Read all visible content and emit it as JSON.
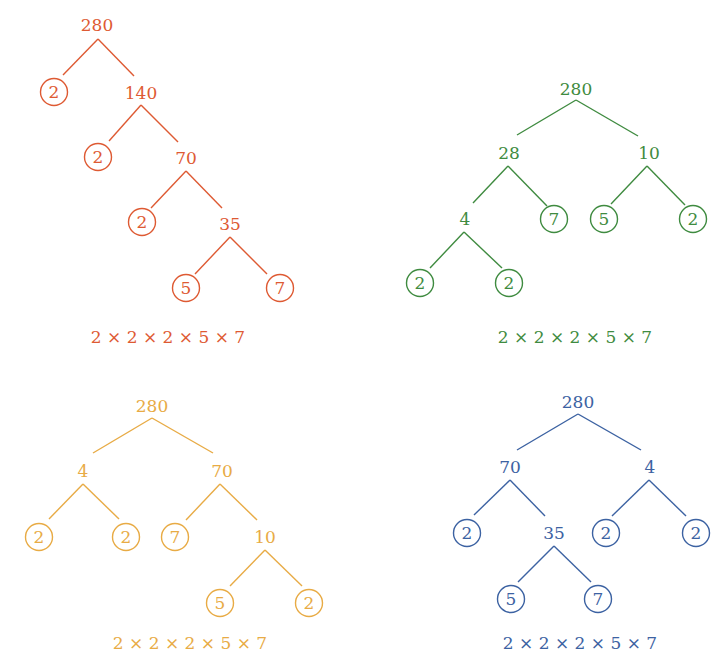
{
  "title": "Factor trees of 280",
  "colors": {
    "red": "#DE5A33",
    "green": "#3F8B40",
    "yellow": "#E8AB45",
    "blue": "#3C62A2"
  },
  "trees": [
    {
      "id": "tree-red",
      "color": "#DE5A33",
      "formula": "2 × 2 × 2 × 5 × 7",
      "formula_pos": [
        168,
        343
      ],
      "nodes": [
        {
          "id": "a",
          "label": "280",
          "x": 97,
          "y": 25,
          "prime": false
        },
        {
          "id": "b",
          "label": "2",
          "x": 54,
          "y": 92,
          "prime": true
        },
        {
          "id": "c",
          "label": "140",
          "x": 141,
          "y": 93,
          "prime": false
        },
        {
          "id": "d",
          "label": "2",
          "x": 98,
          "y": 157,
          "prime": true
        },
        {
          "id": "e",
          "label": "70",
          "x": 186,
          "y": 158,
          "prime": false
        },
        {
          "id": "f",
          "label": "2",
          "x": 142,
          "y": 222,
          "prime": true
        },
        {
          "id": "g",
          "label": "35",
          "x": 230,
          "y": 224,
          "prime": false
        },
        {
          "id": "h",
          "label": "5",
          "x": 186,
          "y": 288,
          "prime": true
        },
        {
          "id": "i",
          "label": "7",
          "x": 280,
          "y": 288,
          "prime": true
        }
      ],
      "edges": [
        [
          [
            98,
            39
          ],
          [
            63,
            75
          ]
        ],
        [
          [
            98,
            39
          ],
          [
            134,
            76
          ]
        ],
        [
          [
            141,
            105
          ],
          [
            109,
            141
          ]
        ],
        [
          [
            141,
            105
          ],
          [
            178,
            142
          ]
        ],
        [
          [
            186,
            171
          ],
          [
            151,
            208
          ]
        ],
        [
          [
            186,
            171
          ],
          [
            222,
            208
          ]
        ],
        [
          [
            230,
            237
          ],
          [
            195,
            274
          ]
        ],
        [
          [
            230,
            237
          ],
          [
            267,
            274
          ]
        ]
      ]
    },
    {
      "id": "tree-green",
      "color": "#3F8B40",
      "formula": "2 × 2 × 2 × 5 × 7",
      "formula_pos": [
        575,
        343
      ],
      "nodes": [
        {
          "id": "a",
          "label": "280",
          "x": 576,
          "y": 89,
          "prime": false
        },
        {
          "id": "b",
          "label": "28",
          "x": 509,
          "y": 153,
          "prime": false
        },
        {
          "id": "c",
          "label": "10",
          "x": 649,
          "y": 153,
          "prime": false
        },
        {
          "id": "d",
          "label": "4",
          "x": 465,
          "y": 219,
          "prime": false
        },
        {
          "id": "e",
          "label": "7",
          "x": 554,
          "y": 219,
          "prime": true
        },
        {
          "id": "f",
          "label": "5",
          "x": 604,
          "y": 219,
          "prime": true
        },
        {
          "id": "g",
          "label": "2",
          "x": 693,
          "y": 219,
          "prime": true
        },
        {
          "id": "h",
          "label": "2",
          "x": 420,
          "y": 283,
          "prime": true
        },
        {
          "id": "i",
          "label": "2",
          "x": 509,
          "y": 283,
          "prime": true
        }
      ],
      "edges": [
        [
          [
            576,
            100
          ],
          [
            517,
            135
          ]
        ],
        [
          [
            576,
            100
          ],
          [
            638,
            136
          ]
        ],
        [
          [
            508,
            166
          ],
          [
            473,
            203
          ]
        ],
        [
          [
            508,
            166
          ],
          [
            547,
            206
          ]
        ],
        [
          [
            647,
            166
          ],
          [
            611,
            204
          ]
        ],
        [
          [
            647,
            166
          ],
          [
            685,
            205
          ]
        ],
        [
          [
            464,
            232
          ],
          [
            430,
            268
          ]
        ],
        [
          [
            464,
            232
          ],
          [
            502,
            268
          ]
        ]
      ]
    },
    {
      "id": "tree-yellow",
      "color": "#E8AB45",
      "formula": "2 × 2 × 2 × 5 × 7",
      "formula_pos": [
        190,
        649
      ],
      "nodes": [
        {
          "id": "a",
          "label": "280",
          "x": 152,
          "y": 406,
          "prime": false
        },
        {
          "id": "b",
          "label": "4",
          "x": 83,
          "y": 471,
          "prime": false
        },
        {
          "id": "c",
          "label": "70",
          "x": 222,
          "y": 471,
          "prime": false
        },
        {
          "id": "d",
          "label": "2",
          "x": 39,
          "y": 537,
          "prime": true
        },
        {
          "id": "e",
          "label": "2",
          "x": 126,
          "y": 537,
          "prime": true
        },
        {
          "id": "f",
          "label": "7",
          "x": 175,
          "y": 537,
          "prime": true
        },
        {
          "id": "g",
          "label": "10",
          "x": 265,
          "y": 537,
          "prime": false
        },
        {
          "id": "h",
          "label": "5",
          "x": 220,
          "y": 603,
          "prime": true
        },
        {
          "id": "i",
          "label": "2",
          "x": 309,
          "y": 603,
          "prime": true
        }
      ],
      "edges": [
        [
          [
            152,
            418
          ],
          [
            93,
            453
          ]
        ],
        [
          [
            152,
            418
          ],
          [
            213,
            453
          ]
        ],
        [
          [
            83,
            484
          ],
          [
            49,
            519
          ]
        ],
        [
          [
            83,
            484
          ],
          [
            119,
            519
          ]
        ],
        [
          [
            220,
            484
          ],
          [
            186,
            520
          ]
        ],
        [
          [
            220,
            484
          ],
          [
            257,
            520
          ]
        ],
        [
          [
            265,
            550
          ],
          [
            230,
            586
          ]
        ],
        [
          [
            265,
            550
          ],
          [
            302,
            586
          ]
        ]
      ]
    },
    {
      "id": "tree-blue",
      "color": "#3C62A2",
      "formula": "2 × 2 × 2 × 5 × 7",
      "formula_pos": [
        580,
        649
      ],
      "nodes": [
        {
          "id": "a",
          "label": "280",
          "x": 578,
          "y": 402,
          "prime": false
        },
        {
          "id": "b",
          "label": "70",
          "x": 510,
          "y": 467,
          "prime": false
        },
        {
          "id": "c",
          "label": "4",
          "x": 650,
          "y": 467,
          "prime": false
        },
        {
          "id": "d",
          "label": "2",
          "x": 467,
          "y": 533,
          "prime": true
        },
        {
          "id": "e",
          "label": "35",
          "x": 554,
          "y": 533,
          "prime": false
        },
        {
          "id": "f",
          "label": "2",
          "x": 606,
          "y": 533,
          "prime": true
        },
        {
          "id": "g",
          "label": "2",
          "x": 696,
          "y": 533,
          "prime": true
        },
        {
          "id": "h",
          "label": "5",
          "x": 511,
          "y": 599,
          "prime": true
        },
        {
          "id": "i",
          "label": "7",
          "x": 598,
          "y": 599,
          "prime": true
        }
      ],
      "edges": [
        [
          [
            578,
            414
          ],
          [
            517,
            450
          ]
        ],
        [
          [
            578,
            414
          ],
          [
            641,
            450
          ]
        ],
        [
          [
            510,
            480
          ],
          [
            474,
            515
          ]
        ],
        [
          [
            510,
            480
          ],
          [
            545,
            516
          ]
        ],
        [
          [
            649,
            480
          ],
          [
            612,
            516
          ]
        ],
        [
          [
            649,
            480
          ],
          [
            686,
            516
          ]
        ],
        [
          [
            554,
            546
          ],
          [
            518,
            582
          ]
        ],
        [
          [
            554,
            546
          ],
          [
            591,
            582
          ]
        ]
      ]
    }
  ],
  "circle_radius": 13.5
}
